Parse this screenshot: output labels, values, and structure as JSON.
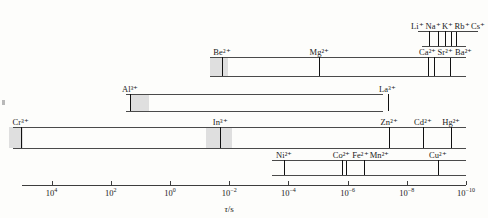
{
  "figure": {
    "axis": {
      "title_symbol": "τ",
      "title_unit": "/s",
      "title_full": "τ/s",
      "scale": "log10-decreasing",
      "range_log10": [
        5,
        -10
      ],
      "ticks": [
        {
          "mantissa": "10",
          "exponent": "4",
          "log10": 4
        },
        {
          "mantissa": "10",
          "exponent": "2",
          "log10": 2
        },
        {
          "mantissa": "10",
          "exponent": "0",
          "log10": 0
        },
        {
          "mantissa": "10",
          "exponent": "−2",
          "log10": -2
        },
        {
          "mantissa": "10",
          "exponent": "−4",
          "log10": -4
        },
        {
          "mantissa": "10",
          "exponent": "−6",
          "log10": -6
        },
        {
          "mantissa": "10",
          "exponent": "−8",
          "log10": -8
        },
        {
          "mantissa": "10",
          "exponent": "−10",
          "log10": -10
        }
      ]
    },
    "bands": [
      {
        "id": "alkali",
        "row": 0,
        "start_log10": -8.5,
        "end_log10": -10.0,
        "shade": null,
        "ions": [
          {
            "ion": "Li",
            "charge": "+",
            "label": "Li⁺",
            "log10": -8.75,
            "label_side": "above",
            "leader": true
          },
          {
            "ion": "Na",
            "charge": "+",
            "label": "Na⁺",
            "log10": -9.05,
            "label_side": "above",
            "leader": true
          },
          {
            "ion": "K",
            "charge": "+",
            "label": "K⁺",
            "log10": -9.3,
            "label_side": "above",
            "leader": true
          },
          {
            "ion": "Rb",
            "charge": "+",
            "label": "Rb⁺",
            "log10": -9.5,
            "label_side": "above",
            "leader": true
          },
          {
            "ion": "Cs",
            "charge": "+",
            "label": "Cs⁺",
            "log10": -9.65,
            "label_side": "above",
            "leader": true
          }
        ]
      },
      {
        "id": "alkaline-earth",
        "row": 1,
        "start_log10": -1.35,
        "end_log10": -10.0,
        "shade": {
          "from_log10": -1.35,
          "to_log10": -1.95
        },
        "ions": [
          {
            "ion": "Be",
            "charge": "2+",
            "label": "Be²⁺",
            "log10": -1.75,
            "label_side": "above",
            "leader": false
          },
          {
            "ion": "Mg",
            "charge": "2+",
            "label": "Mg²⁺",
            "log10": -5.05,
            "label_side": "above",
            "leader": false
          },
          {
            "ion": "Ca",
            "charge": "2+",
            "label": "Ca²⁺",
            "log10": -8.7,
            "label_side": "above",
            "leader": true
          },
          {
            "ion": "Sr",
            "charge": "2+",
            "label": "Sr²⁺",
            "log10": -8.92,
            "label_side": "above",
            "leader": true
          },
          {
            "ion": "Ba",
            "charge": "2+",
            "label": "Ba²⁺",
            "log10": -9.45,
            "label_side": "above",
            "leader": true
          }
        ]
      },
      {
        "id": "trivalent-main",
        "row": 2,
        "start_log10": 1.5,
        "end_log10": -7.2,
        "shade": {
          "from_log10": 1.35,
          "to_log10": 0.7
        },
        "ions": [
          {
            "ion": "Al",
            "charge": "3+",
            "label": "Al³⁺",
            "log10": 1.35,
            "label_side": "above",
            "leader": false
          },
          {
            "ion": "La",
            "charge": "3+",
            "label": "La³⁺",
            "log10": -7.35,
            "label_side": "above",
            "leader": false
          }
        ]
      },
      {
        "id": "trivalent-heavy",
        "row": 3,
        "start_log10": 5.3,
        "end_log10": -10.0,
        "shade": [
          {
            "from_log10": 5.45,
            "to_log10": 4.95
          },
          {
            "from_log10": -1.2,
            "to_log10": -2.1
          }
        ],
        "ions": [
          {
            "ion": "Cr",
            "charge": "3+",
            "label": "Cr³⁺",
            "log10": 5.05,
            "label_side": "above",
            "leader": false
          },
          {
            "ion": "In",
            "charge": "3+",
            "label": "In³⁺",
            "log10": -1.7,
            "label_side": "above",
            "leader": false
          },
          {
            "ion": "Zn",
            "charge": "2+",
            "label": "Zn²⁺",
            "log10": -7.4,
            "label_side": "above",
            "leader": false
          },
          {
            "ion": "Cd",
            "charge": "2+",
            "label": "Cd²⁺",
            "log10": -8.55,
            "label_side": "above",
            "leader": false
          },
          {
            "ion": "Hg",
            "charge": "2+",
            "label": "Hg²⁺",
            "log10": -9.5,
            "label_side": "above",
            "leader": false
          }
        ]
      },
      {
        "id": "transition",
        "row": 4,
        "start_log10": -3.45,
        "end_log10": -10.0,
        "shade": null,
        "ions": [
          {
            "ion": "Ni",
            "charge": "2+",
            "label": "Ni²⁺",
            "log10": -3.85,
            "label_side": "above",
            "leader": false
          },
          {
            "ion": "Co",
            "charge": "2+",
            "label": "Co²⁺",
            "log10": -5.8,
            "label_side": "above",
            "leader": true
          },
          {
            "ion": "Fe",
            "charge": "2+",
            "label": "Fe²⁺",
            "log10": -5.95,
            "label_side": "above",
            "leader": true
          },
          {
            "ion": "Mn",
            "charge": "2+",
            "label": "Mn²⁺",
            "log10": -6.55,
            "label_side": "above",
            "leader": false
          },
          {
            "ion": "Cu",
            "charge": "2+",
            "label": "Cu²⁺",
            "log10": -9.05,
            "label_side": "above",
            "leader": false
          }
        ]
      }
    ]
  },
  "chart_data": {
    "type": "bar",
    "title": "",
    "subtitle": "",
    "xlabel": "τ/s",
    "ylabel": "",
    "xscale": "log",
    "xlim": [
      100000,
      1e-10
    ],
    "x_axis_direction": "decreasing",
    "x_tick_labels": [
      "10⁴",
      "10²",
      "10⁰",
      "10⁻²",
      "10⁻⁴",
      "10⁻⁶",
      "10⁻⁸",
      "10⁻¹⁰"
    ],
    "x_tick_log10": [
      4,
      2,
      0,
      -2,
      -4,
      -6,
      -8,
      -10
    ],
    "grid": false,
    "legend": false,
    "series": [
      {
        "name": "Alkali metal ions",
        "band_range_log10": [
          -8.5,
          -10.0
        ],
        "points": [
          {
            "label": "Li⁺",
            "log10_tau": -8.75
          },
          {
            "label": "Na⁺",
            "log10_tau": -9.05
          },
          {
            "label": "K⁺",
            "log10_tau": -9.3
          },
          {
            "label": "Rb⁺",
            "log10_tau": -9.5
          },
          {
            "label": "Cs⁺",
            "log10_tau": -9.65
          }
        ]
      },
      {
        "name": "Alkaline earth ions",
        "band_range_log10": [
          -1.35,
          -10.0
        ],
        "points": [
          {
            "label": "Be²⁺",
            "log10_tau": -1.75
          },
          {
            "label": "Mg²⁺",
            "log10_tau": -5.05
          },
          {
            "label": "Ca²⁺",
            "log10_tau": -8.7
          },
          {
            "label": "Sr²⁺",
            "log10_tau": -8.92
          },
          {
            "label": "Ba²⁺",
            "log10_tau": -9.45
          }
        ]
      },
      {
        "name": "Al/La trivalent ions",
        "band_range_log10": [
          1.5,
          -7.2
        ],
        "points": [
          {
            "label": "Al³⁺",
            "log10_tau": 1.35
          },
          {
            "label": "La³⁺",
            "log10_tau": -7.35
          }
        ]
      },
      {
        "name": "Cr/In and d10 divalent ions",
        "band_range_log10": [
          5.3,
          -10.0
        ],
        "points": [
          {
            "label": "Cr³⁺",
            "log10_tau": 5.05
          },
          {
            "label": "In³⁺",
            "log10_tau": -1.7
          },
          {
            "label": "Zn²⁺",
            "log10_tau": -7.4
          },
          {
            "label": "Cd²⁺",
            "log10_tau": -8.55
          },
          {
            "label": "Hg²⁺",
            "log10_tau": -9.5
          }
        ]
      },
      {
        "name": "First-row transition divalent ions",
        "band_range_log10": [
          -3.45,
          -10.0
        ],
        "points": [
          {
            "label": "Ni²⁺",
            "log10_tau": -3.85
          },
          {
            "label": "Co²⁺",
            "log10_tau": -5.8
          },
          {
            "label": "Fe²⁺",
            "log10_tau": -5.95
          },
          {
            "label": "Mn²⁺",
            "log10_tau": -6.55
          },
          {
            "label": "Cu²⁺",
            "log10_tau": -9.05
          }
        ]
      }
    ]
  }
}
